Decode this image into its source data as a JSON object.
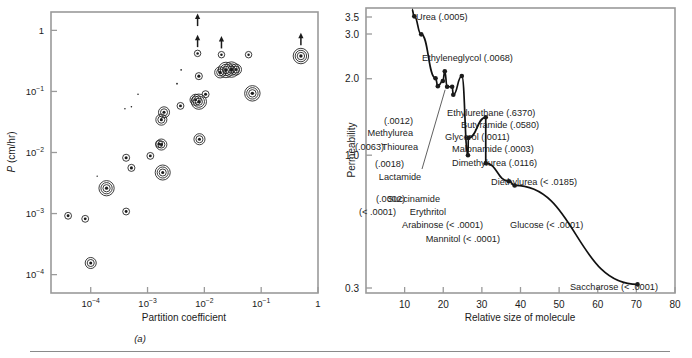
{
  "figure": {
    "caption_a": "(a)",
    "caption_b": "(b)"
  },
  "chart_data": [
    {
      "type": "scatter",
      "panel": "a",
      "title": "",
      "xlabel": "Partition coefficient",
      "ylabel": "P (cm/hr)",
      "xscale": "log",
      "yscale": "log",
      "xlim": [
        2e-05,
        1
      ],
      "ylim": [
        5e-05,
        2
      ],
      "grid": false,
      "xticks": [
        "10-4",
        "10-3",
        "10-2",
        "10-1",
        "1"
      ],
      "xtick_values": [
        0.0001,
        0.001,
        0.01,
        0.1,
        1
      ],
      "yticks": [
        "1",
        "10-1",
        "10-2",
        "10-3",
        "10-4"
      ],
      "ytick_values": [
        1,
        0.1,
        0.01,
        0.001,
        0.0001
      ],
      "marker_note": "concentric-ring markers; ring count varies by point; arrows indicate lower-bound points",
      "points": [
        {
          "x": 4e-05,
          "y": 0.00092,
          "rings": 1,
          "size": 3.0,
          "arrow": false
        },
        {
          "x": 8e-05,
          "y": 0.00082,
          "rings": 1,
          "size": 3.0,
          "arrow": false
        },
        {
          "x": 0.0001,
          "y": 0.000155,
          "rings": 2,
          "size": 3.2,
          "arrow": false
        },
        {
          "x": 0.00019,
          "y": 0.0026,
          "rings": 3,
          "size": 3.4,
          "arrow": false
        },
        {
          "x": 0.00013,
          "y": 0.0041,
          "rings": 0,
          "size": 1.5,
          "arrow": false
        },
        {
          "x": 0.00042,
          "y": 0.00108,
          "rings": 1,
          "size": 3.0,
          "arrow": false
        },
        {
          "x": 0.00042,
          "y": 0.0082,
          "rings": 1,
          "size": 3.2,
          "arrow": false
        },
        {
          "x": 0.00052,
          "y": 0.0056,
          "rings": 1,
          "size": 3.2,
          "arrow": false
        },
        {
          "x": 0.00112,
          "y": 0.0088,
          "rings": 1,
          "size": 3.0,
          "arrow": false
        },
        {
          "x": 0.0016,
          "y": 0.0138,
          "rings": 1,
          "size": 3.2,
          "arrow": false
        },
        {
          "x": 0.00175,
          "y": 0.0135,
          "rings": 2,
          "size": 3.2,
          "arrow": false
        },
        {
          "x": 0.00185,
          "y": 0.0047,
          "rings": 3,
          "size": 3.2,
          "arrow": false
        },
        {
          "x": 0.0004,
          "y": 0.052,
          "rings": 0,
          "size": 1.6,
          "arrow": false
        },
        {
          "x": 0.00052,
          "y": 0.056,
          "rings": 0,
          "size": 1.6,
          "arrow": false
        },
        {
          "x": 0.00068,
          "y": 0.09,
          "rings": 0,
          "size": 1.6,
          "arrow": false
        },
        {
          "x": 0.00175,
          "y": 0.0345,
          "rings": 2,
          "size": 3.2,
          "arrow": false
        },
        {
          "x": 0.00195,
          "y": 0.0455,
          "rings": 2,
          "size": 3.2,
          "arrow": false
        },
        {
          "x": 0.0033,
          "y": 0.134,
          "rings": 0,
          "size": 1.8,
          "arrow": false
        },
        {
          "x": 0.0039,
          "y": 0.225,
          "rings": 0,
          "size": 1.7,
          "arrow": false
        },
        {
          "x": 0.0038,
          "y": 0.058,
          "rings": 1,
          "size": 3.0,
          "arrow": false
        },
        {
          "x": 0.007,
          "y": 0.073,
          "rings": 2,
          "size": 3.2,
          "arrow": false
        },
        {
          "x": 0.008,
          "y": 0.068,
          "rings": 3,
          "size": 3.4,
          "arrow": false
        },
        {
          "x": 0.008,
          "y": 0.178,
          "rings": 1,
          "size": 3.2,
          "arrow": false
        },
        {
          "x": 0.0076,
          "y": 0.42,
          "rings": 1,
          "size": 2.6,
          "arrow": true
        },
        {
          "x": 0.0076,
          "y": 1.05,
          "rings": 0,
          "size": 0.0,
          "arrow": true
        },
        {
          "x": 0.0082,
          "y": 0.0165,
          "rings": 2,
          "size": 3.2,
          "arrow": false
        },
        {
          "x": 0.0105,
          "y": 0.09,
          "rings": 1,
          "size": 3.2,
          "arrow": false
        },
        {
          "x": 0.019,
          "y": 0.205,
          "rings": 2,
          "size": 3.2,
          "arrow": false
        },
        {
          "x": 0.02,
          "y": 0.4,
          "rings": 1,
          "size": 2.6,
          "arrow": true
        },
        {
          "x": 0.024,
          "y": 0.225,
          "rings": 3,
          "size": 3.6,
          "arrow": false
        },
        {
          "x": 0.03,
          "y": 0.228,
          "rings": 3,
          "size": 3.6,
          "arrow": false
        },
        {
          "x": 0.036,
          "y": 0.228,
          "rings": 2,
          "size": 3.2,
          "arrow": false
        },
        {
          "x": 0.06,
          "y": 0.4,
          "rings": 1,
          "size": 2.6,
          "arrow": false
        },
        {
          "x": 0.07,
          "y": 0.093,
          "rings": 3,
          "size": 3.6,
          "arrow": false
        },
        {
          "x": 0.5,
          "y": 0.38,
          "rings": 3,
          "size": 3.6,
          "arrow": true
        }
      ]
    },
    {
      "type": "line",
      "panel": "b",
      "title": "",
      "xlabel": "Relative size of molecule",
      "ylabel": "Permeability",
      "grid": false,
      "xlim": [
        0,
        80
      ],
      "ylim": [
        0.1,
        3.75
      ],
      "xticks": [
        "10",
        "20",
        "30",
        "40",
        "50",
        "60",
        "70",
        "80"
      ],
      "xtick_values": [
        10,
        20,
        30,
        40,
        50,
        60,
        70,
        80
      ],
      "yticks": [
        "3.5",
        "3.0",
        "2.0",
        "1.0",
        "0.3"
      ],
      "ytick_values": [
        3.5,
        3.0,
        2.0,
        1.0,
        0.3
      ],
      "curve_note": "monotonically decreasing hyperbola-like curve through the data points",
      "labeled_points": [
        {
          "name": "Urea",
          "value": "(.0005)",
          "label": "Urea (.0005)",
          "x": 12.5,
          "y": 3.52,
          "lx": 416,
          "ly": 20,
          "anchor": "start",
          "arrow": false
        },
        {
          "name": "Ethyleneglycol",
          "value": "(.0068)",
          "label": "Ethyleneglycol (.0068)",
          "x": 14.3,
          "y": 2.99,
          "lx": 422,
          "ly": 61,
          "anchor": "start",
          "arrow": false
        },
        {
          "name": "Methylurea",
          "value": "(.0012)",
          "label": "Methylurea",
          "x": 18.0,
          "y": 2.01,
          "lx": 413,
          "ly": 136,
          "anchor": "end",
          "arrow": false
        },
        {
          "name": "Thiourea",
          "value": "(.0063)",
          "label": "Thiourea",
          "x": 18.6,
          "y": 1.87,
          "lx": 418,
          "ly": 150,
          "anchor": "end",
          "arrow": false
        },
        {
          "name": "Lactamide",
          "value": "(.0018)",
          "label": "Lactamide",
          "x": 21.0,
          "y": 1.86,
          "lx": 400,
          "ly": 180,
          "anchor": "middle",
          "arrow": true
        },
        {
          "name": "Ethylurethane",
          "value": "(.6370)",
          "label": "Ethylurethane (.6370)",
          "x": 20.4,
          "y": 2.14,
          "lx": 447,
          "ly": 116,
          "anchor": "start",
          "arrow": false
        },
        {
          "name": "Butyramide",
          "value": "(.0580)",
          "label": "Butyramide (.0580)",
          "x": 24.8,
          "y": 2.05,
          "lx": 461,
          "ly": 128,
          "anchor": "start",
          "arrow": false
        },
        {
          "name": "Glycerol",
          "value": "(.0011)",
          "label": "Glycerol (.0011)",
          "x": 19.9,
          "y": 1.96,
          "lx": 445,
          "ly": 140,
          "anchor": "start",
          "arrow": false
        },
        {
          "name": "Malonamide",
          "value": "(.0003)",
          "label": "Malonamide (.0003)",
          "x": 22.3,
          "y": 1.86,
          "lx": 452,
          "ly": 152,
          "anchor": "start",
          "arrow": false
        },
        {
          "name": "Dimethylurea",
          "value": "(.0116)",
          "label": "Dimethylurea (.0116)",
          "x": 22.6,
          "y": 1.73,
          "lx": 452,
          "ly": 166,
          "anchor": "start",
          "arrow": false
        },
        {
          "name": "Diethylurea",
          "value": "(< .0185)",
          "label": "Diethylurea (< .0185)",
          "x": 31.0,
          "y": 1.41,
          "lx": 491,
          "ly": 185,
          "anchor": "start",
          "arrow": false
        },
        {
          "name": "Succinamide",
          "value": "(.0002)",
          "label": "Succinamide",
          "x": 26.5,
          "y": 1.17,
          "lx": 440,
          "ly": 202,
          "anchor": "end",
          "arrow": false
        },
        {
          "name": "Erythritol",
          "value": "(< .0001)",
          "label": "Erythritol",
          "x": 26.4,
          "y": 1.0,
          "lx": 446,
          "ly": 215,
          "anchor": "end",
          "arrow": false
        },
        {
          "name": "Arabinose",
          "value": "(< .0001)",
          "label": "Arabinose (< .0001)",
          "x": 31.0,
          "y": 0.93,
          "lx": 483,
          "ly": 228,
          "anchor": "end",
          "arrow": false
        },
        {
          "name": "Mannitol",
          "value": "(< .0001)",
          "label": "Mannitol (< .0001)",
          "x": 37.0,
          "y": 0.79,
          "lx": 500,
          "ly": 242,
          "anchor": "end",
          "arrow": false
        },
        {
          "name": "Glucose",
          "value": "(< .0001)",
          "label": "Glucose (< .0001)",
          "x": 38.5,
          "y": 0.76,
          "lx": 510,
          "ly": 228,
          "anchor": "start",
          "arrow": false
        },
        {
          "name": "Saccharose",
          "value": "(< .0001)",
          "label": "Saccharose (< .0001)",
          "x": 70.3,
          "y": 0.31,
          "lx": 658,
          "ly": 290,
          "anchor": "end",
          "arrow": false
        }
      ],
      "prefix_values": [
        {
          "text": "(.0012)",
          "lx": 413,
          "ly": 124,
          "anchor": "end"
        },
        {
          "text": "(.0063)",
          "lx": 355,
          "ly": 150,
          "anchor": "start"
        },
        {
          "text": "(.0018)",
          "lx": 404,
          "ly": 167,
          "anchor": "end"
        },
        {
          "text": "(.0002)",
          "lx": 376,
          "ly": 202,
          "anchor": "start"
        },
        {
          "text": "(< .0001)",
          "lx": 359,
          "ly": 215,
          "anchor": "start"
        }
      ]
    }
  ]
}
